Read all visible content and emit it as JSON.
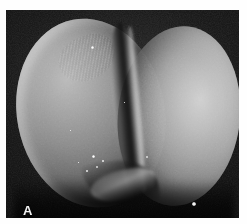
{
  "figure": {
    "panel_label": "A",
    "image_type": "scanning-electron-micrograph",
    "background_color": "#ffffff",
    "field_color": "#0a0a0a",
    "highlight_color": "#d6d6d6",
    "label_color": "#f2f2f2",
    "field": {
      "left": 6,
      "top": 10,
      "width": 233,
      "height": 208
    },
    "structures": [
      {
        "name": "blastomere-left",
        "description": "left blastomere"
      },
      {
        "name": "blastomere-right",
        "description": "right blastomere"
      },
      {
        "name": "cleavage-furrow",
        "description": "cleavage furrow between blastomeres"
      }
    ],
    "surface_debris": [
      {
        "name": "debris-particle-1",
        "left": 86,
        "top": 145,
        "size": 3.4
      },
      {
        "name": "debris-particle-2",
        "left": 90,
        "top": 156,
        "size": 2.2
      },
      {
        "name": "debris-particle-3",
        "left": 80,
        "top": 160,
        "size": 1.6
      },
      {
        "name": "debris-particle-4",
        "left": 96,
        "top": 150,
        "size": 1.5
      },
      {
        "name": "debris-particle-5",
        "left": 72,
        "top": 152,
        "size": 1.4
      },
      {
        "name": "debris-particle-6",
        "left": 85,
        "top": 36,
        "size": 3.0
      },
      {
        "name": "debris-particle-7",
        "left": 140,
        "top": 146,
        "size": 2.0
      },
      {
        "name": "debris-particle-8",
        "left": 186,
        "top": 192,
        "size": 3.6
      },
      {
        "name": "debris-particle-9",
        "left": 118,
        "top": 92,
        "size": 1.3
      },
      {
        "name": "debris-particle-10",
        "left": 64,
        "top": 120,
        "size": 1.2
      }
    ]
  }
}
